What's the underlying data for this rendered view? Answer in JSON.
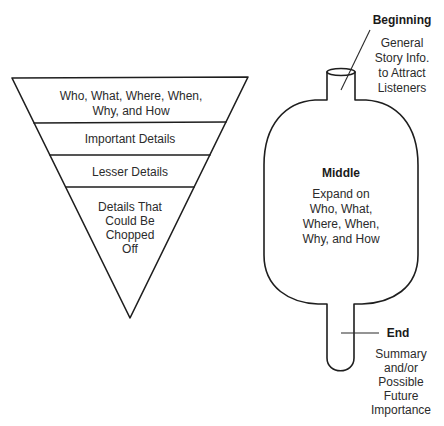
{
  "inverted_pyramid": {
    "sections": [
      {
        "lines": [
          "Who, What, Where, When,",
          "Why, and How"
        ]
      },
      {
        "lines": [
          "Important Details"
        ]
      },
      {
        "lines": [
          "Lesser Details"
        ]
      },
      {
        "lines": [
          "Details That",
          "Could Be",
          "Chopped",
          "Off"
        ]
      }
    ]
  },
  "hourglass_bottle": {
    "beginning": {
      "title": "Beginning",
      "lines": [
        "General",
        "Story Info.",
        "to Attract",
        "Listeners"
      ]
    },
    "middle": {
      "title": "Middle",
      "lines": [
        "Expand on",
        "Who, What,",
        "Where, When,",
        "Why, and How"
      ]
    },
    "end": {
      "title": "End",
      "lines": [
        "Summary",
        "and/or",
        "Possible",
        "Future",
        "Importance"
      ]
    }
  },
  "colors": {
    "stroke": "#1e1e1e",
    "text": "#2b2b2b",
    "background": "#ffffff"
  }
}
